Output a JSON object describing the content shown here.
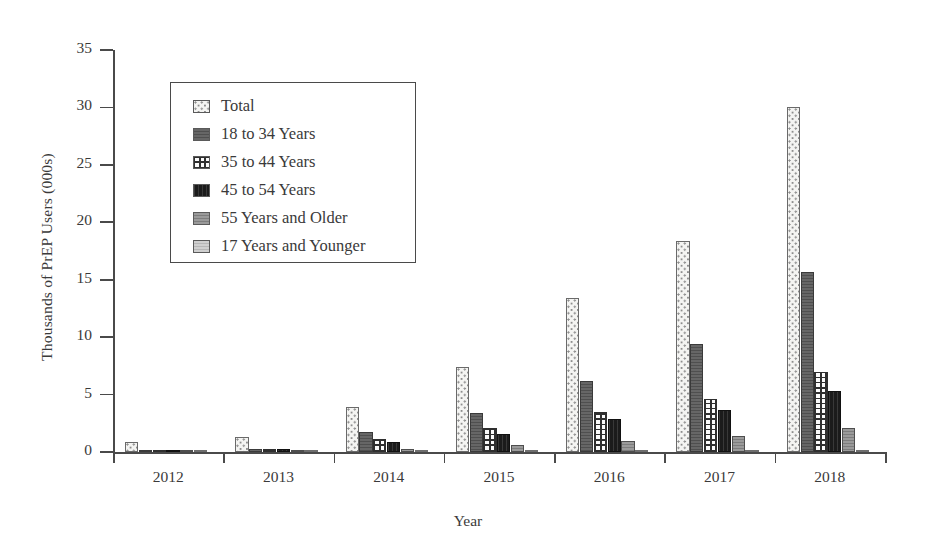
{
  "chart_data": {
    "type": "bar",
    "title": "",
    "xlabel": "Year",
    "ylabel": "Thousands of PrEP Users (000s)",
    "categories": [
      "2012",
      "2013",
      "2014",
      "2015",
      "2016",
      "2017",
      "2018"
    ],
    "ylim": [
      0,
      35
    ],
    "yticks": [
      0,
      5,
      10,
      15,
      20,
      25,
      30,
      35
    ],
    "ytick_labels": [
      "0",
      "5",
      "10",
      "15",
      "20",
      "25",
      "30",
      "35"
    ],
    "grid": false,
    "legend_position": "upper-left-inside",
    "series": [
      {
        "name": "Total",
        "key": "total",
        "fill": "dotted-light",
        "color": "#f4f4f2",
        "values": [
          0.9,
          1.3,
          3.9,
          7.4,
          13.4,
          18.4,
          30.0
        ]
      },
      {
        "name": "18 to 34 Years",
        "key": "age-18-34",
        "fill": "solid-dark-gray",
        "color": "#5e5e5e",
        "values": [
          0.15,
          0.3,
          1.7,
          3.4,
          6.2,
          9.4,
          15.7
        ]
      },
      {
        "name": "35 to 44 Years",
        "key": "age-35-44",
        "fill": "cross-hatch",
        "color": "#fafafa",
        "values": [
          0.1,
          0.25,
          1.1,
          2.1,
          3.5,
          4.6,
          7.0
        ]
      },
      {
        "name": "45 to 54 Years",
        "key": "age-45-54",
        "fill": "near-black",
        "color": "#1b1b1b",
        "values": [
          0.1,
          0.25,
          0.9,
          1.6,
          2.9,
          3.7,
          5.3
        ]
      },
      {
        "name": "55 Years and Older",
        "key": "age-55-plus",
        "fill": "medium-gray",
        "color": "#8e8e8e",
        "values": [
          0.05,
          0.2,
          0.3,
          0.6,
          1.0,
          1.4,
          2.1
        ]
      },
      {
        "name": "17 Years and Younger",
        "key": "age-17-under",
        "fill": "light-gray",
        "color": "#c4c4c4",
        "values": [
          0.02,
          0.05,
          0.07,
          0.15,
          0.15,
          0.18,
          0.2
        ]
      }
    ]
  }
}
